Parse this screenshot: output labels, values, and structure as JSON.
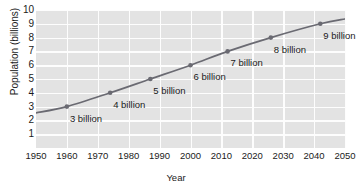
{
  "chart_data": {
    "type": "line",
    "title": "",
    "xlabel": "Year",
    "ylabel": "Population (billions)",
    "xlim": [
      1950,
      2050
    ],
    "ylim": [
      0,
      10
    ],
    "grid": true,
    "legend": "none",
    "xticks": [
      "1950",
      "1960",
      "1970",
      "1980",
      "1990",
      "2000",
      "2010",
      "2020",
      "2030",
      "2040",
      "2050"
    ],
    "yticks": [
      "10",
      "9",
      "8",
      "7",
      "6",
      "5",
      "4",
      "3",
      "2",
      "1"
    ],
    "series": [
      {
        "name": "World population",
        "color": "#6a6a72",
        "x": [
          1950,
          1960,
          1974,
          1987,
          2000,
          2012,
          2026,
          2042,
          2050
        ],
        "values": [
          2.55,
          3.0,
          4.0,
          5.0,
          6.0,
          7.0,
          8.0,
          9.0,
          9.35
        ]
      }
    ],
    "markers": [
      {
        "year": 1960,
        "value": 3,
        "label": "3 billion"
      },
      {
        "year": 1974,
        "value": 4,
        "label": "4 billion"
      },
      {
        "year": 1987,
        "value": 5,
        "label": "5 billion"
      },
      {
        "year": 2000,
        "value": 6,
        "label": "6 billion"
      },
      {
        "year": 2012,
        "value": 7,
        "label": "7 billion"
      },
      {
        "year": 2026,
        "value": 8,
        "label": "8 billion"
      },
      {
        "year": 2042,
        "value": 9,
        "label": "9 billion"
      }
    ],
    "colors": {
      "plot_background": "#e3e3e3",
      "gridline": "#fdfdfd",
      "line": "#6a6a72",
      "text": "#1b1b1b",
      "page_background": "#ffffff"
    }
  }
}
